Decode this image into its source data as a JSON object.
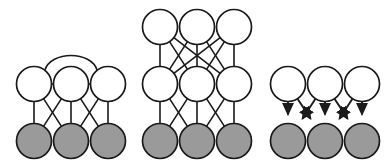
{
  "figure": {
    "background_color": "#ffffff",
    "width": 389,
    "height": 168,
    "stroke_color": "#1a1a1a",
    "visible_node_color": "#ffffff",
    "hidden_node_color": "#9a9a9a",
    "node_radius": 17.5,
    "panels": [
      {
        "id": "panel-left",
        "name": "boltzmann-machine",
        "edge_style": "undirected",
        "layers": [
          {
            "name": "top-row",
            "type": "visible",
            "fill": "#ffffff",
            "nodes": [
              {
                "id": "L-T1",
                "cx": 34,
                "cy": 84
              },
              {
                "id": "L-T2",
                "cx": 71,
                "cy": 84
              },
              {
                "id": "L-T3",
                "cx": 108,
                "cy": 84
              }
            ]
          },
          {
            "name": "bottom-row",
            "type": "hidden",
            "fill": "#9a9a9a",
            "nodes": [
              {
                "id": "L-B1",
                "cx": 34,
                "cy": 141
              },
              {
                "id": "L-B2",
                "cx": 71,
                "cy": 141
              },
              {
                "id": "L-B3",
                "cx": 108,
                "cy": 141
              }
            ]
          }
        ],
        "lateral_edges": [
          {
            "from": "L-T1",
            "to": "L-T2",
            "shape": "straight"
          },
          {
            "from": "L-T2",
            "to": "L-T3",
            "shape": "straight"
          },
          {
            "from": "L-T1",
            "to": "L-T3",
            "shape": "arc-over"
          }
        ],
        "interlayer_edges": [
          {
            "from": "L-T1",
            "to": "L-B1"
          },
          {
            "from": "L-T1",
            "to": "L-B2"
          },
          {
            "from": "L-T2",
            "to": "L-B1"
          },
          {
            "from": "L-T2",
            "to": "L-B2"
          },
          {
            "from": "L-T2",
            "to": "L-B3"
          },
          {
            "from": "L-T3",
            "to": "L-B2"
          },
          {
            "from": "L-T3",
            "to": "L-B3"
          }
        ]
      },
      {
        "id": "panel-middle",
        "name": "deep-belief-network",
        "edge_style": "undirected",
        "layers": [
          {
            "name": "top-row",
            "type": "visible",
            "fill": "#ffffff",
            "nodes": [
              {
                "id": "M-T1",
                "cx": 160,
                "cy": 27
              },
              {
                "id": "M-T2",
                "cx": 197,
                "cy": 27
              },
              {
                "id": "M-T3",
                "cx": 234,
                "cy": 27
              }
            ]
          },
          {
            "name": "middle-row",
            "type": "visible",
            "fill": "#ffffff",
            "nodes": [
              {
                "id": "M-M1",
                "cx": 160,
                "cy": 84
              },
              {
                "id": "M-M2",
                "cx": 197,
                "cy": 84
              },
              {
                "id": "M-M3",
                "cx": 234,
                "cy": 84
              }
            ]
          },
          {
            "name": "bottom-row",
            "type": "hidden",
            "fill": "#9a9a9a",
            "nodes": [
              {
                "id": "M-B1",
                "cx": 160,
                "cy": 141
              },
              {
                "id": "M-B2",
                "cx": 197,
                "cy": 141
              },
              {
                "id": "M-B3",
                "cx": 234,
                "cy": 141
              }
            ]
          }
        ],
        "lateral_edges": [],
        "interlayer_edges": [
          {
            "from": "M-T1",
            "to": "M-M1"
          },
          {
            "from": "M-T1",
            "to": "M-M2"
          },
          {
            "from": "M-T1",
            "to": "M-M3"
          },
          {
            "from": "M-T2",
            "to": "M-M1"
          },
          {
            "from": "M-T2",
            "to": "M-M2"
          },
          {
            "from": "M-T2",
            "to": "M-M3"
          },
          {
            "from": "M-T3",
            "to": "M-M1"
          },
          {
            "from": "M-T3",
            "to": "M-M2"
          },
          {
            "from": "M-T3",
            "to": "M-M3"
          },
          {
            "from": "M-M1",
            "to": "M-B1"
          },
          {
            "from": "M-M1",
            "to": "M-B2"
          },
          {
            "from": "M-M2",
            "to": "M-B1"
          },
          {
            "from": "M-M2",
            "to": "M-B2"
          },
          {
            "from": "M-M2",
            "to": "M-B3"
          },
          {
            "from": "M-M3",
            "to": "M-B2"
          },
          {
            "from": "M-M3",
            "to": "M-B3"
          }
        ]
      },
      {
        "id": "panel-right",
        "name": "directed-belief-network",
        "edge_style": "directed",
        "layers": [
          {
            "name": "top-row",
            "type": "visible",
            "fill": "#ffffff",
            "nodes": [
              {
                "id": "R-T1",
                "cx": 288,
                "cy": 84
              },
              {
                "id": "R-T2",
                "cx": 325,
                "cy": 84
              },
              {
                "id": "R-T3",
                "cx": 362,
                "cy": 84
              }
            ]
          },
          {
            "name": "bottom-row",
            "type": "hidden",
            "fill": "#9a9a9a",
            "nodes": [
              {
                "id": "R-B1",
                "cx": 288,
                "cy": 141
              },
              {
                "id": "R-B2",
                "cx": 325,
                "cy": 141
              },
              {
                "id": "R-B3",
                "cx": 362,
                "cy": 141
              }
            ]
          }
        ],
        "lateral_edges": [],
        "interlayer_edges": [
          {
            "from": "R-T1",
            "to": "R-B1"
          },
          {
            "from": "R-T1",
            "to": "R-B2"
          },
          {
            "from": "R-T2",
            "to": "R-B1"
          },
          {
            "from": "R-T2",
            "to": "R-B2"
          },
          {
            "from": "R-T2",
            "to": "R-B3"
          },
          {
            "from": "R-T3",
            "to": "R-B2"
          },
          {
            "from": "R-T3",
            "to": "R-B3"
          }
        ]
      }
    ]
  }
}
